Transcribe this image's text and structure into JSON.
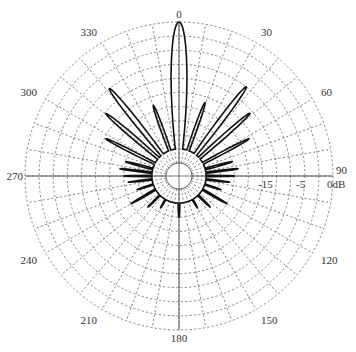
{
  "chart_data": {
    "type": "polar",
    "title": "",
    "center": [
      179,
      176
    ],
    "outer_radius": 154,
    "inner_radius": 13,
    "ring_count": 10,
    "radial_step_deg": 10,
    "angle_labels": [
      {
        "angle": 0,
        "text": "0"
      },
      {
        "angle": 30,
        "text": "30"
      },
      {
        "angle": 60,
        "text": "60"
      },
      {
        "angle": 90,
        "text": "90"
      },
      {
        "angle": 120,
        "text": "120"
      },
      {
        "angle": 150,
        "text": "150"
      },
      {
        "angle": 180,
        "text": "180"
      },
      {
        "angle": 210,
        "text": "210"
      },
      {
        "angle": 240,
        "text": "240"
      },
      {
        "angle": 270,
        "text": "270"
      },
      {
        "angle": 300,
        "text": "300"
      },
      {
        "angle": 330,
        "text": "330"
      }
    ],
    "radial_labels": [
      {
        "text": "0dB",
        "x": 327,
        "y": 188
      },
      {
        "text": "-5",
        "x": 296,
        "y": 188
      },
      {
        "text": "-15",
        "x": 258,
        "y": 188
      }
    ],
    "pattern_lobes": [
      {
        "angle": 0,
        "r": 1.0,
        "width": 8.5
      },
      {
        "angle": 19.5,
        "r": 0.46,
        "width": 3.2
      },
      {
        "angle": -20,
        "r": 0.44,
        "width": 3.2
      },
      {
        "angle": 37,
        "r": 0.7,
        "width": 3.8
      },
      {
        "angle": -38.5,
        "r": 0.7,
        "width": 3.8
      },
      {
        "angle": 48.5,
        "r": 0.58,
        "width": 3.2
      },
      {
        "angle": -49.5,
        "r": 0.59,
        "width": 3.2
      },
      {
        "angle": 62,
        "r": 0.47,
        "width": 2.6
      },
      {
        "angle": -63,
        "r": 0.49,
        "width": 2.6
      },
      {
        "angle": 75,
        "r": 0.3,
        "width": 2.2
      },
      {
        "angle": -75,
        "r": 0.3,
        "width": 2.2
      },
      {
        "angle": 83,
        "r": 0.33,
        "width": 1.8
      },
      {
        "angle": -83,
        "r": 0.33,
        "width": 1.8
      },
      {
        "angle": 90,
        "r": 0.3,
        "width": 1.6
      },
      {
        "angle": -90,
        "r": 0.3,
        "width": 1.6
      },
      {
        "angle": 97,
        "r": 0.27,
        "width": 1.6
      },
      {
        "angle": -97,
        "r": 0.27,
        "width": 1.6
      },
      {
        "angle": 108,
        "r": 0.22,
        "width": 1.8
      },
      {
        "angle": -108,
        "r": 0.22,
        "width": 1.8
      },
      {
        "angle": 120,
        "r": 0.3,
        "width": 2.0
      },
      {
        "angle": -120,
        "r": 0.3,
        "width": 2.0
      },
      {
        "angle": 135,
        "r": 0.22,
        "width": 2.0
      },
      {
        "angle": -135,
        "r": 0.22,
        "width": 2.0
      },
      {
        "angle": 150,
        "r": 0.17,
        "width": 2.0
      },
      {
        "angle": -150,
        "r": 0.17,
        "width": 2.0
      },
      {
        "angle": 180,
        "r": 0.2,
        "width": 3.0
      }
    ],
    "grid": true,
    "axis_lines": [
      "0-180",
      "90-270"
    ]
  }
}
